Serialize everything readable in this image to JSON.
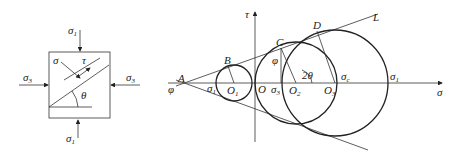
{
  "element_diagram": {
    "top_load": {
      "sym": "σ",
      "sub": "1"
    },
    "bottom_load": {
      "sym": "σ",
      "sub": "1"
    },
    "left_load": {
      "sym": "σ",
      "sub": "3"
    },
    "right_load": {
      "sym": "σ",
      "sub": "3"
    },
    "normal_stress": "σ",
    "shear_stress": "τ",
    "angle": "θ"
  },
  "mohr_diagram": {
    "axis_x": "σ",
    "axis_y": "τ",
    "point_A": "A",
    "point_B": "B",
    "point_C": "C",
    "point_D": "D",
    "line_L": "L",
    "origin": "O",
    "center_1": {
      "sym": "O",
      "sub": "1"
    },
    "center_2": {
      "sym": "O",
      "sub": "2"
    },
    "center_3": {
      "sym": "O",
      "sub": "3"
    },
    "sigma_1_left": {
      "sym": "σ",
      "sub": "1"
    },
    "sigma_3": {
      "sym": "σ",
      "sub": "3"
    },
    "sigma_c": {
      "sym": "σ",
      "sub": "c"
    },
    "sigma_1_right": {
      "sym": "σ",
      "sub": "1"
    },
    "phi_A": "φ",
    "phi_C": "φ",
    "two_theta": "2θ"
  }
}
